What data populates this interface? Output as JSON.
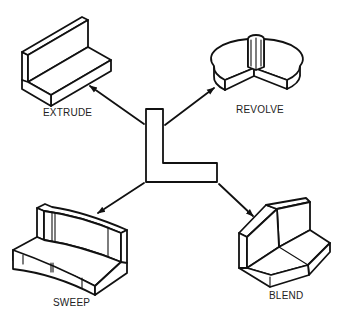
{
  "diagram": {
    "center_profile": {
      "name": "L-profile",
      "shape": "L"
    },
    "operations": [
      {
        "id": "extrude",
        "label": "EXTRUDE"
      },
      {
        "id": "revolve",
        "label": "REVOLVE"
      },
      {
        "id": "sweep",
        "label": "SWEEP"
      },
      {
        "id": "blend",
        "label": "BLEND"
      }
    ],
    "line_color": "#111111",
    "background": "#ffffff"
  }
}
